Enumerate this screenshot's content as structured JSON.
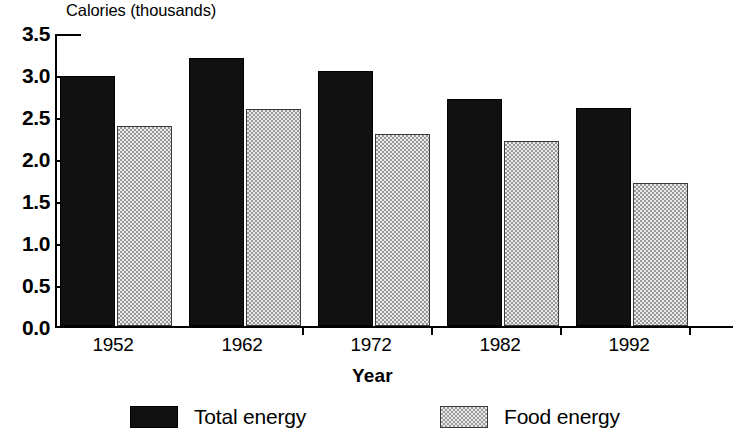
{
  "chart_data": {
    "type": "bar",
    "title": "",
    "ylabel": "Calories (thousands)",
    "xlabel": "Year",
    "categories": [
      "1952",
      "1962",
      "1972",
      "1982",
      "1992"
    ],
    "series": [
      {
        "name": "Total energy",
        "values": [
          3.0,
          3.21,
          3.06,
          2.72,
          2.61
        ],
        "color": "#111111",
        "fill": "solid-black"
      },
      {
        "name": "Food energy",
        "values": [
          2.4,
          2.6,
          2.3,
          2.22,
          1.72
        ],
        "color": "#c9c9c9",
        "fill": "gray-checker"
      }
    ],
    "ylim": [
      0.0,
      3.5
    ],
    "ytick_step": 0.5,
    "ytick_labels": [
      "3.5",
      "3.0",
      "2.5",
      "2.0",
      "1.5",
      "1.0",
      "0.5",
      "0.0"
    ],
    "ytick_values": [
      3.5,
      3.0,
      2.5,
      2.0,
      1.5,
      1.0,
      0.5,
      0.0
    ],
    "grid": false,
    "legend_position": "bottom",
    "legend_entries": [
      "Total energy",
      "Food energy"
    ],
    "axis_color": "#000000",
    "background_color": "#ffffff"
  }
}
